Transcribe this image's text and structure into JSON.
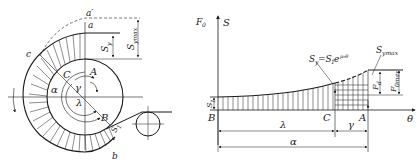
{
  "left_figure": {
    "title": "Belt wrapped around driving pulley with tension distribution",
    "labels": {
      "a_prime": "a′",
      "a": "a",
      "c": "c",
      "b": "b",
      "C": "C",
      "A": "A",
      "B": "B",
      "alpha": "α",
      "gamma": "γ",
      "lambda": "λ",
      "Sy": "S",
      "Sy_sub": "y",
      "Symax": "S",
      "Symax_sub": "ymax",
      "S1": "S",
      "S1_sub": "1"
    }
  },
  "right_figure": {
    "title": "Tension S vs wrap angle θ",
    "axis": {
      "y_label_F": "F",
      "y_label_F_sub": "0",
      "y_label_S": "S",
      "x_label": "θ"
    },
    "labels": {
      "formula": "S",
      "formula_sub": "y",
      "formula_rest": "=S",
      "formula_sub2": "1",
      "formula_exp_base": "e",
      "formula_exp": "μ₀θ",
      "Symax": "S",
      "Symax_sub": "ymax",
      "S1": "S",
      "S1_sub": "1",
      "Fd": "F",
      "Fd_sub": "d",
      "F0max": "F",
      "F0max_sub": "0max",
      "B": "B",
      "C": "C",
      "A": "A",
      "lambda": "λ",
      "gamma": "γ",
      "alpha": "α"
    }
  },
  "colors": {
    "line": "#1a1a1a",
    "dashed": "#555555",
    "background": "#ffffff"
  }
}
